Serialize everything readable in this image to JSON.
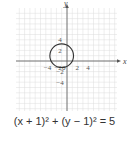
{
  "chart_data": {
    "type": "line",
    "title": "",
    "xlabel": "x",
    "ylabel": "y",
    "xlim": [
      -5,
      5
    ],
    "ylim": [
      -5,
      5
    ],
    "grid": true,
    "x_ticks": [
      -4,
      -2,
      0,
      2,
      4
    ],
    "y_ticks": [
      4,
      2,
      -2,
      -4
    ],
    "tick_labels": {
      "x": [
        "-4",
        "-2",
        "0",
        "2",
        "4"
      ],
      "y": [
        "4",
        "2",
        "-2",
        "-4"
      ]
    },
    "series": [
      {
        "name": "circle",
        "shape": "circle",
        "center": [
          -1,
          1
        ],
        "radius": 2.236
      }
    ],
    "caption": "(x + 1)² + (y − 1)² = 5"
  },
  "caption": {
    "text": "(x + 1)² + (y − 1)² = 5"
  },
  "axes": {
    "x_label": "x",
    "y_label": "y"
  }
}
